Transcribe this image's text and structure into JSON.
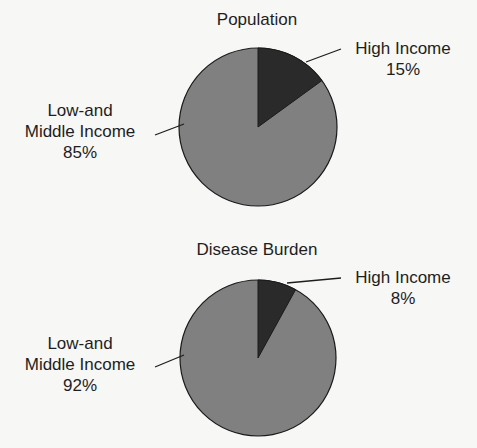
{
  "chart_data": [
    {
      "type": "pie",
      "title": "Population",
      "categories": [
        "High Income",
        "Low-and Middle Income"
      ],
      "values": [
        15,
        85
      ],
      "unit": "%",
      "labels": [
        {
          "name_lines": [
            "High Income"
          ],
          "value": "15%"
        },
        {
          "name_lines": [
            "Low-and",
            "Middle Income"
          ],
          "value": "85%"
        }
      ],
      "colors": [
        "#2a2a2a",
        "#808080"
      ],
      "legend": "none (direct labels with leader lines)"
    },
    {
      "type": "pie",
      "title": "Disease Burden",
      "categories": [
        "High Income",
        "Low-and Middle Income"
      ],
      "values": [
        8,
        92
      ],
      "unit": "%",
      "labels": [
        {
          "name_lines": [
            "High Income"
          ],
          "value": "8%"
        },
        {
          "name_lines": [
            "Low-and",
            "Middle Income"
          ],
          "value": "92%"
        }
      ],
      "colors": [
        "#2a2a2a",
        "#808080"
      ],
      "legend": "none (direct labels with leader lines)"
    }
  ],
  "colors": {
    "high_income": "#2a2a2a",
    "low_middle_income": "#808080",
    "outline": "#1a1a1a",
    "background": "#f7f7f5"
  }
}
